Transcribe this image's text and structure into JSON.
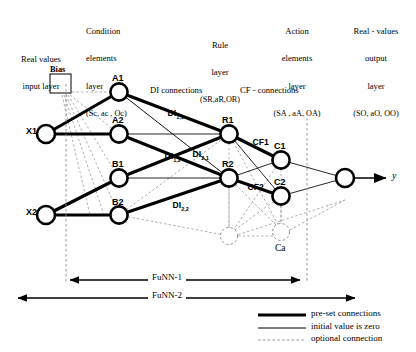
{
  "figure": {
    "headers": [
      {
        "id": "input-layer",
        "lines": [
          "Real values",
          "input layer"
        ],
        "tuple": ""
      },
      {
        "id": "condition-layer",
        "lines": [
          "Condition",
          "elements",
          "layer"
        ],
        "tuple": "(Sc, ac , Oc)"
      },
      {
        "id": "rule-layer",
        "lines": [
          "Rule",
          "layer"
        ],
        "tuple": "(SR,aR,OR)"
      },
      {
        "id": "action-layer",
        "lines": [
          "Action",
          "elements",
          "layer"
        ],
        "tuple": "(SA , aA, OA)"
      },
      {
        "id": "output-layer",
        "lines": [
          "Real - values",
          "output",
          "layer"
        ],
        "tuple": "(SO, aO, OO)"
      }
    ],
    "bias_label": "Bias",
    "nodes": [
      {
        "id": "x1",
        "label": "X1"
      },
      {
        "id": "x2",
        "label": "X2"
      },
      {
        "id": "a1",
        "label": "A1"
      },
      {
        "id": "a2",
        "label": "A2"
      },
      {
        "id": "b1",
        "label": "B1"
      },
      {
        "id": "b2",
        "label": "B2"
      },
      {
        "id": "r1",
        "label": "R1"
      },
      {
        "id": "r2",
        "label": "R2"
      },
      {
        "id": "c1",
        "label": "C1"
      },
      {
        "id": "c2",
        "label": "C2"
      },
      {
        "id": "ca",
        "label": "Ca"
      },
      {
        "id": "out",
        "label": ""
      }
    ],
    "connection_group_labels": [
      {
        "id": "di-connections",
        "text": "DI connections"
      },
      {
        "id": "cf-connections",
        "text": "CF - connections"
      }
    ],
    "edge_labels": [
      {
        "id": "di-1-1",
        "base": "DI",
        "sub": "1,1"
      },
      {
        "id": "di-1-2",
        "base": "DI",
        "sub": "1,2"
      },
      {
        "id": "di-2-1",
        "base": "DI",
        "sub": "2,1"
      },
      {
        "id": "di-2-2",
        "base": "DI",
        "sub": "2,2"
      },
      {
        "id": "cf-1",
        "base": "CF1",
        "sub": ""
      },
      {
        "id": "cf-2",
        "base": "CF2",
        "sub": ""
      }
    ],
    "output_label": "y",
    "spans": [
      {
        "id": "funn-1",
        "label": "FuNN-1"
      },
      {
        "id": "funn-2",
        "label": "FuNN-2"
      }
    ],
    "legend": [
      {
        "id": "preset",
        "style": "thick",
        "text": "pre-set connections"
      },
      {
        "id": "zero",
        "style": "thin",
        "text": "initial value is zero"
      },
      {
        "id": "optional",
        "style": "dashed",
        "text": "optional connection"
      }
    ],
    "colors": {
      "ink": "#000000",
      "paper": "#ffffff",
      "dashed": "#7a7a7a"
    }
  }
}
